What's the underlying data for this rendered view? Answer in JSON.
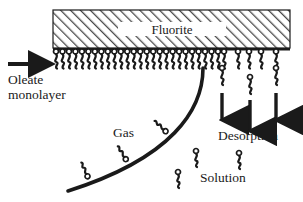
{
  "figure": {
    "name": "oleate-monolayer-desorption-diagram",
    "background_color": "#ffffff",
    "ink_color": "#1a1a1a",
    "width": 303,
    "height": 202
  },
  "substrate": {
    "label": "Fluorite",
    "shape": "hatched-rectangle",
    "hatch_direction": "forward-slash",
    "hatch_color": "#5a5a5a",
    "border_color": "#1a1a1a",
    "x": 53,
    "y": 10,
    "w": 237,
    "h": 38,
    "label_band": {
      "x": 118,
      "y": 22,
      "w": 108,
      "h": 14
    }
  },
  "annotations": {
    "oleate_arrow": {
      "icon": "right-arrow-icon",
      "x1": 8,
      "y1": 64,
      "x2": 52,
      "y2": 64
    },
    "oleate_label_line1": "Oleate",
    "oleate_label_line2": "monolayer",
    "gas_label": "Gas",
    "desorption_label": "Desorption",
    "solution_label": "Solution"
  },
  "monolayer": {
    "description": "dense oleate molecules anchored head-up to fluorite underside",
    "baseline_y": 50,
    "dense": {
      "start_x": 56,
      "end_x": 218,
      "count": 26
    },
    "sparse_x": [
      224,
      238,
      249,
      261,
      276
    ]
  },
  "gas_bubble": {
    "description": "thick arc marking gas/solution interface",
    "stroke_width": 3.6,
    "path": "M 203 68 C 203 110, 172 158, 68 191",
    "attached_molecules": [
      {
        "t": 0.4,
        "x": 182,
        "y": 119
      },
      {
        "t": 0.66,
        "x": 153,
        "y": 152
      },
      {
        "t": 0.88,
        "x": 107,
        "y": 177
      }
    ]
  },
  "desorption_arrows": [
    {
      "x": 222,
      "y1": 93,
      "y2": 127,
      "name": "desorption-arrow-1"
    },
    {
      "x": 250,
      "y1": 100,
      "y2": 138,
      "name": "desorption-arrow-2"
    },
    {
      "x": 276,
      "y1": 93,
      "y2": 127,
      "name": "desorption-arrow-3"
    }
  ],
  "desorbing_molecules": [
    {
      "x": 222,
      "y": 68
    },
    {
      "x": 250,
      "y": 77
    },
    {
      "x": 276,
      "y": 68
    }
  ],
  "solution_molecules": [
    {
      "x": 196,
      "y": 151
    },
    {
      "x": 239,
      "y": 153
    },
    {
      "x": 178,
      "y": 172
    }
  ]
}
